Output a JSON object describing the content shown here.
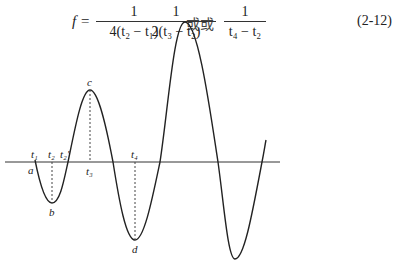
{
  "formula": {
    "lhs": "f =",
    "fractions": [
      {
        "numerator": "1",
        "denominator": "4(t₂ − t₁)"
      },
      {
        "numerator": "1",
        "denominator": "2(t₃ − t₂)"
      },
      {
        "numerator": "1",
        "denominator": "t₄ − t₂"
      }
    ],
    "connectors": [
      "或",
      "或"
    ],
    "equation_number": "(2-12)"
  },
  "figure": {
    "axis_labels": {
      "t1": "t₁",
      "t2": "t₂",
      "t2_prime": "t₂′",
      "t3": "t₃",
      "t4": "t₄"
    },
    "point_labels": {
      "a": "a",
      "b": "b",
      "c": "c",
      "d": "d"
    },
    "colors": {
      "curve": "#222222",
      "axis": "#333333",
      "dashed": "#444444"
    }
  }
}
